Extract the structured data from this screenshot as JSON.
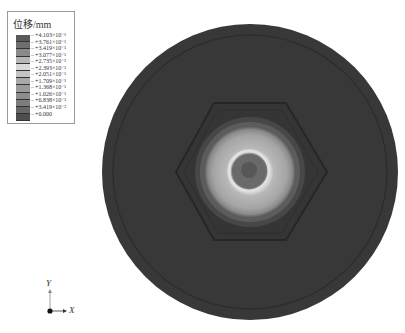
{
  "legend": {
    "title": "位移/mm",
    "entries": [
      "+4.103×10⁻¹",
      "+3.761×10⁻¹",
      "+3.419×10⁻¹",
      "+3.077×10⁻¹",
      "+2.735×10⁻¹",
      "+2.393×10⁻¹",
      "+2.051×10⁻¹",
      "+1.709×10⁻¹",
      "+1.368×10⁻¹",
      "+1.026×10⁻¹",
      "+6.838×10⁻²",
      "+3.419×10⁻²",
      "+0.000"
    ],
    "band_colors": [
      "#5a5a5a",
      "#6e6e6e",
      "#8a8a8a",
      "#b5b5b5",
      "#d8d8d8",
      "#c4c4c4",
      "#a8a8a8",
      "#9a9a9a",
      "#8c8c8c",
      "#7c7c7c",
      "#666666",
      "#4e4e4e"
    ]
  },
  "axis": {
    "x_label": "X",
    "y_label": "Y"
  },
  "model": {
    "disc_color": "#3b3b3b",
    "hex_color": "#363636",
    "ring_outer_color": "#6a6a6a",
    "ring_light_color": "#a8a8a8",
    "ring_inner_color": "#cfcfcf",
    "core_color": "#5e5e5e"
  }
}
